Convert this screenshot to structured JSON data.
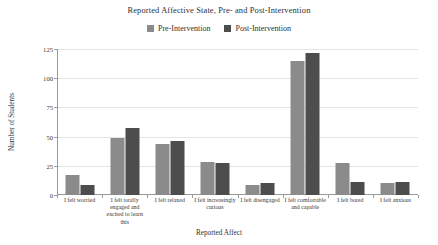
{
  "chart_data": {
    "type": "bar",
    "title": "Reported Affective State, Pre- and Post-Intervention",
    "xlabel": "Reported Affect",
    "ylabel": "Number of Students",
    "ylim": [
      0,
      125
    ],
    "yticks": [
      0,
      25,
      50,
      75,
      100,
      125
    ],
    "grid": true,
    "legend_position": "top-center",
    "categories": [
      "I felt worried",
      "I felt totally engaged and excited to learn this",
      "I felt relaxed",
      "I felt increasingly curious",
      "I felt disengaged",
      "I felt comfortable and capable",
      "I felt bored",
      "I felt anxious"
    ],
    "series": [
      {
        "name": "Pre-Intervention",
        "color": "#8b8b8b",
        "values": [
          17,
          49,
          44,
          28,
          9,
          115,
          27,
          10
        ]
      },
      {
        "name": "Post-Intervention",
        "color": "#4d4d4d",
        "values": [
          9,
          57,
          46,
          27,
          10,
          122,
          11,
          11
        ]
      }
    ]
  },
  "axis": {
    "ytick_labels": [
      "125",
      "100",
      "75",
      "50",
      "25",
      "0"
    ]
  }
}
